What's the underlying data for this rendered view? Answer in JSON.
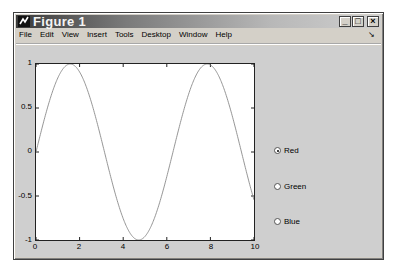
{
  "window": {
    "title": "Figure 1",
    "controls": {
      "minimize": "_",
      "maximize": "□",
      "close": "×"
    }
  },
  "menubar": {
    "items": [
      "File",
      "Edit",
      "View",
      "Insert",
      "Tools",
      "Desktop",
      "Window",
      "Help"
    ],
    "dock_arrow": "↘"
  },
  "radio_group": {
    "options": [
      {
        "label": "Red",
        "checked": true
      },
      {
        "label": "Green",
        "checked": false
      },
      {
        "label": "Blue",
        "checked": false
      }
    ]
  },
  "colors": {
    "window_bg": "#d4d0c8",
    "canvas_bg": "#cfcfcf",
    "axes_bg": "#ffffff",
    "line": "#8a8a8a"
  },
  "chart_data": {
    "type": "line",
    "title": "",
    "xlabel": "",
    "ylabel": "",
    "xlim": [
      0,
      10
    ],
    "ylim": [
      -1,
      1
    ],
    "xticks": [
      "0",
      "2",
      "4",
      "6",
      "8",
      "10"
    ],
    "yticks": [
      "1",
      "0.5",
      "0",
      "-0.5",
      "-1"
    ],
    "grid": false,
    "series": [
      {
        "name": "sin(x)",
        "function": "y = sin(x)",
        "x": [
          0,
          0.5,
          1,
          1.5708,
          2,
          2.5,
          3,
          3.1416,
          3.5,
          4,
          4.5,
          4.7124,
          5,
          5.5,
          6,
          6.2832,
          6.5,
          7,
          7.5,
          7.854,
          8,
          8.5,
          9,
          9.4248,
          9.5,
          10
        ],
        "values": [
          0,
          0.479,
          0.841,
          1,
          0.909,
          0.598,
          0.141,
          0,
          -0.351,
          -0.757,
          -0.978,
          -1,
          -0.959,
          -0.706,
          -0.279,
          0,
          0.215,
          0.657,
          0.938,
          1,
          0.989,
          0.798,
          0.412,
          0,
          -0.075,
          -0.544
        ]
      }
    ]
  }
}
